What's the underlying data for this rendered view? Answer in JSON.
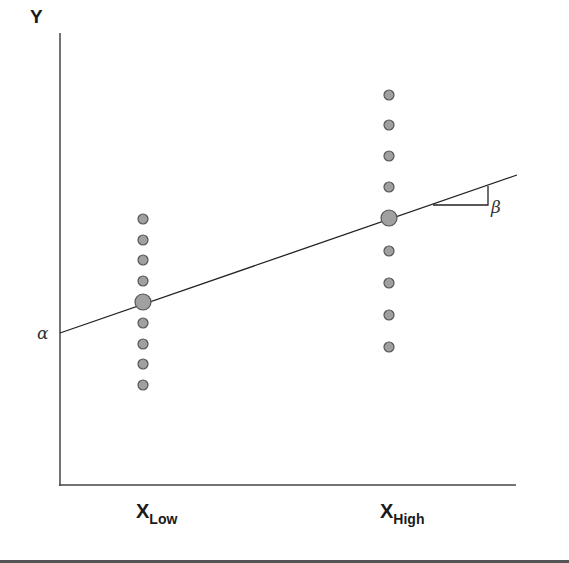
{
  "diagram": {
    "title": "",
    "y_axis_label": "Y",
    "intercept_label": "α",
    "slope_label": "β",
    "x_low_label": {
      "main": "X",
      "sub": "Low"
    },
    "x_high_label": {
      "main": "X",
      "sub": "High"
    },
    "colors": {
      "axis": "#444444",
      "line": "#222222",
      "point_fill": "#a0a0a0",
      "point_stroke": "#555555"
    }
  },
  "chart_data": {
    "type": "scatter",
    "title": "",
    "xlabel": "",
    "ylabel": "Y",
    "categories": [
      "X_Low",
      "X_High"
    ],
    "series": [
      {
        "name": "X_Low observations",
        "x": "X_Low",
        "y_pixels": [
          219,
          240,
          260,
          281,
          323,
          344,
          364,
          385
        ]
      },
      {
        "name": "X_Low mean",
        "x": "X_Low",
        "y_pixels": [
          302
        ]
      },
      {
        "name": "X_High observations",
        "x": "X_High",
        "y_pixels": [
          95,
          125,
          156,
          187,
          251,
          283,
          315,
          347
        ]
      },
      {
        "name": "X_High mean",
        "x": "X_High",
        "y_pixels": [
          218
        ]
      }
    ],
    "regression_line": {
      "intercept_label": "α",
      "slope_label": "β",
      "from": [
        60,
        333
      ],
      "to": [
        517,
        175
      ]
    },
    "grid": false,
    "legend": "none"
  }
}
